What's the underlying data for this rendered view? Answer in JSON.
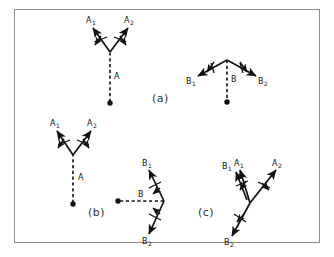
{
  "figure": {
    "kind": "vector-decomposition-diagram",
    "background_color": "#ffffff",
    "frame_border_color": "#8c8c8c",
    "stroke_color": "#111111",
    "panels": [
      {
        "id": "a",
        "caption": "(a)",
        "groups": [
          {
            "name": "A",
            "origin_label": "A",
            "arrows": [
              {
                "label": "A1",
                "label_base": "A",
                "label_sub": "1"
              },
              {
                "label": "A2",
                "label_base": "A",
                "label_sub": "2"
              }
            ]
          },
          {
            "name": "B",
            "origin_label": "B",
            "arrows": [
              {
                "label": "B1",
                "label_base": "B",
                "label_sub": "1"
              },
              {
                "label": "B2",
                "label_base": "B",
                "label_sub": "2"
              }
            ]
          }
        ]
      },
      {
        "id": "b",
        "caption": "(b)",
        "groups": [
          {
            "name": "A",
            "origin_label": "A",
            "arrows": [
              {
                "label": "A1",
                "label_base": "A",
                "label_sub": "1"
              },
              {
                "label": "A2",
                "label_base": "A",
                "label_sub": "2"
              }
            ]
          },
          {
            "name": "B",
            "origin_label": "B",
            "arrows": [
              {
                "label": "B1",
                "label_base": "B",
                "label_sub": "1"
              },
              {
                "label": "B2",
                "label_base": "B",
                "label_sub": "2"
              }
            ]
          }
        ]
      },
      {
        "id": "c",
        "caption": "(c)",
        "groups": [
          {
            "name": "AB",
            "origin_label": "",
            "arrows": [
              {
                "label": "B1",
                "label_base": "B",
                "label_sub": "1"
              },
              {
                "label": "A1",
                "label_base": "A",
                "label_sub": "1"
              },
              {
                "label": "A2",
                "label_base": "A",
                "label_sub": "2"
              },
              {
                "label": "B2",
                "label_base": "B",
                "label_sub": "2"
              }
            ]
          }
        ]
      }
    ],
    "labels": {
      "panel_a": "(a)",
      "panel_b": "(b)",
      "panel_c": "(c)",
      "a_origin_a": "A",
      "a_origin_b": "B",
      "b_origin_a": "A",
      "b_origin_b": "B",
      "A1": "A",
      "A1_sub": "1",
      "A2": "A",
      "A2_sub": "2",
      "B1": "B",
      "B1_sub": "1",
      "B2": "B",
      "B2_sub": "2"
    }
  }
}
